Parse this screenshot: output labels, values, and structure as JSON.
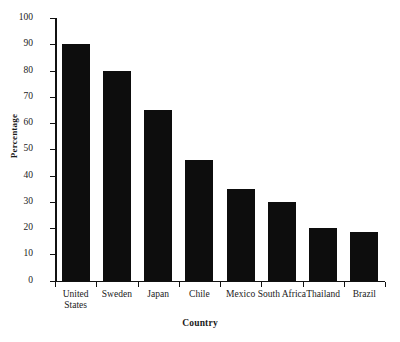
{
  "chart_data": {
    "type": "bar",
    "title": "",
    "xlabel": "Country",
    "ylabel": "Percentage",
    "categories": [
      "United States",
      "Sweden",
      "Japan",
      "Chile",
      "Mexico",
      "South Africa",
      "Thailand",
      "Brazil"
    ],
    "values": [
      90,
      80,
      65,
      46,
      35,
      30,
      20,
      18.5
    ],
    "ylim": [
      0,
      100
    ],
    "yticks": [
      0,
      10,
      20,
      30,
      40,
      50,
      60,
      70,
      80,
      90,
      100
    ],
    "ytick_labels": [
      "0",
      "10",
      "20",
      "30",
      "40",
      "50",
      "60",
      "70",
      "80",
      "90",
      "100"
    ],
    "grid": false,
    "legend": false,
    "bar_color": "#0d0d0d",
    "axis_color": "#111111"
  },
  "axes": {
    "y_title": "Percentage",
    "x_title": "Country"
  }
}
